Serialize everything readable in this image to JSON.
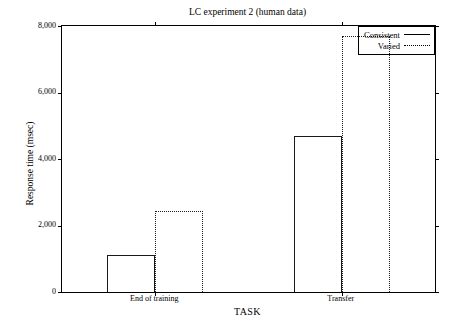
{
  "chart_data": {
    "type": "bar",
    "title": "LC experiment 2 (human data)",
    "xlabel": "TASK",
    "ylabel": "Response time (msec)",
    "categories": [
      "End of training",
      "Transfer"
    ],
    "series": [
      {
        "name": "Consistent",
        "style": "solid",
        "values": [
          1100,
          4700
        ]
      },
      {
        "name": "Varied",
        "style": "dotted",
        "values": [
          2450,
          7700
        ]
      }
    ],
    "ylim": [
      0,
      8000
    ],
    "yticks": [
      0,
      2000,
      4000,
      6000,
      8000
    ],
    "ytick_labels": [
      "0",
      "2,000",
      "4,000",
      "6,000",
      "8,000"
    ],
    "grid": false,
    "legend_position": "top-right-inside",
    "frame": "box",
    "bar_fill": "none",
    "line_color": "#000000"
  },
  "legend": {
    "entries": [
      {
        "label": "Consistent"
      },
      {
        "label": "Varied"
      }
    ]
  }
}
